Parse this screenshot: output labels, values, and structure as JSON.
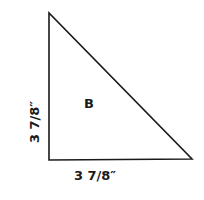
{
  "diagram": {
    "type": "quilt-template-piece",
    "shape": "right-triangle",
    "piece_label": "B",
    "dimensions": {
      "bottom": "3 7/8″",
      "left": "3 7/8″"
    },
    "colors": {
      "stroke": "#1a1a1a",
      "fill": "#ffffff"
    }
  }
}
